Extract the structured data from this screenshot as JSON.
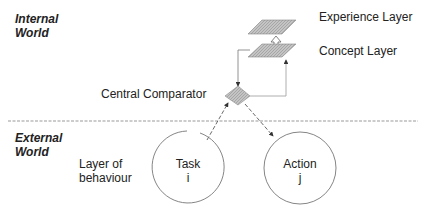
{
  "diagram": {
    "regions": {
      "internal": [
        "Internal",
        "World"
      ],
      "external": [
        "External",
        "World"
      ]
    },
    "layers": {
      "experience": "Experience Layer",
      "concept": "Concept Layer",
      "behaviour": [
        "Layer of",
        "behaviour"
      ]
    },
    "comparator": "Central Comparator",
    "nodes": {
      "task": {
        "title": "Task",
        "index": "i"
      },
      "action": {
        "title": "Action",
        "index": "j"
      }
    },
    "colors": {
      "line": "#666666",
      "fill": "#b8b8b8",
      "divider": "#999999"
    }
  }
}
